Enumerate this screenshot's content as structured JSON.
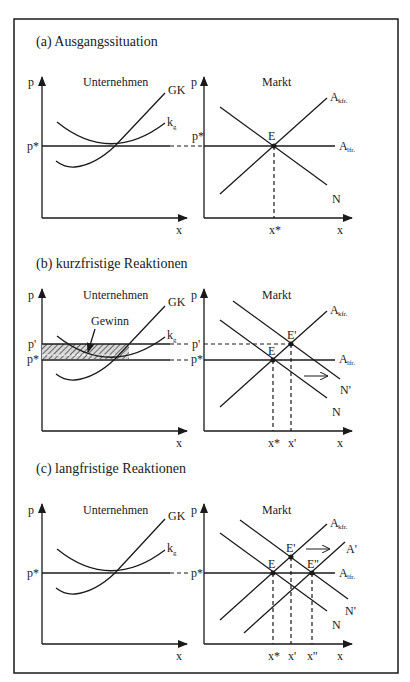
{
  "panels": [
    {
      "title": "(a) Ausgangssituation",
      "left": {
        "heading": "Unternehmen",
        "y_axis": "p",
        "x_axis": "x",
        "price_labels": [
          "p*"
        ],
        "curves": [
          "GK",
          "k",
          "g"
        ]
      },
      "right": {
        "heading": "Markt",
        "y_axis": "p",
        "x_axis": "x",
        "price_labels": [
          "p*"
        ],
        "points": [
          "E"
        ],
        "x_labels": [
          "x*"
        ],
        "curves": {
          "supply_short": "A",
          "supply_short_sub": "kfr.",
          "supply_long": "A",
          "supply_long_sub": "lfr.",
          "demand": "N"
        }
      }
    },
    {
      "title": "(b) kurzfristige Reaktionen",
      "left": {
        "heading": "Unternehmen",
        "y_axis": "p",
        "x_axis": "x",
        "price_labels": [
          "p'",
          "p*"
        ],
        "annotation": "Gewinn",
        "curves": [
          "GK",
          "k",
          "g"
        ]
      },
      "right": {
        "heading": "Markt",
        "y_axis": "p",
        "x_axis": "x",
        "price_labels": [
          "p'",
          "p*"
        ],
        "points": [
          "E",
          "E'"
        ],
        "x_labels": [
          "x*",
          "x'"
        ],
        "curves": {
          "supply_short": "A",
          "supply_short_sub": "kfr.",
          "supply_long": "A",
          "supply_long_sub": "lfr.",
          "demand": "N",
          "demand_new": "N'"
        }
      }
    },
    {
      "title": "(c) langfristige Reaktionen",
      "left": {
        "heading": "Unternehmen",
        "y_axis": "p",
        "x_axis": "x",
        "price_labels": [
          "p*"
        ],
        "curves": [
          "GK",
          "k",
          "g"
        ]
      },
      "right": {
        "heading": "Markt",
        "y_axis": "p",
        "x_axis": "x",
        "price_labels": [
          "p*"
        ],
        "points": [
          "E",
          "E'",
          "E''"
        ],
        "x_labels": [
          "x*",
          "x'",
          "x''"
        ],
        "curves": {
          "supply_short": "A",
          "supply_short_sub": "kfr.",
          "supply_new": "A'",
          "supply_long": "A",
          "supply_long_sub": "lfr.",
          "demand": "N",
          "demand_new": "N'"
        }
      }
    }
  ]
}
